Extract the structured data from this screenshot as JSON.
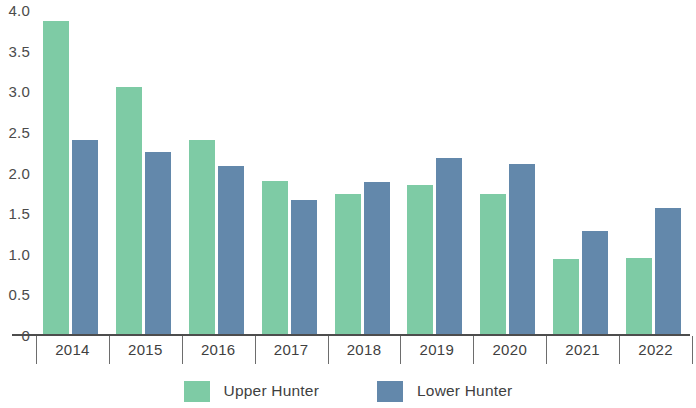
{
  "chart_data": {
    "type": "bar",
    "title": "",
    "xlabel": "",
    "ylabel": "",
    "categories": [
      "2014",
      "2015",
      "2016",
      "2017",
      "2018",
      "2019",
      "2020",
      "2021",
      "2022"
    ],
    "series": [
      {
        "name": "Upper Hunter",
        "color": "#7ecba5",
        "values": [
          3.87,
          3.05,
          2.4,
          1.9,
          1.73,
          1.85,
          1.74,
          0.93,
          0.95
        ]
      },
      {
        "name": "Lower Hunter",
        "color": "#6388ab",
        "values": [
          2.4,
          2.25,
          2.08,
          1.66,
          1.88,
          2.18,
          2.11,
          1.28,
          1.56
        ]
      }
    ],
    "ylim": [
      0,
      4.0
    ],
    "y_ticks": [
      "4.0",
      "3.5",
      "3.0",
      "2.5",
      "2.0",
      "1.5",
      "1.0",
      "0.5",
      "0"
    ],
    "y_tick_values": [
      4.0,
      3.5,
      3.0,
      2.5,
      2.0,
      1.5,
      1.0,
      0.5,
      0
    ],
    "grid": false,
    "legend_position": "bottom"
  },
  "legend": {
    "items": [
      {
        "label": "Upper Hunter",
        "color": "#7ecba5",
        "swatch_name": "legend-swatch-upper-hunter"
      },
      {
        "label": "Lower Hunter",
        "color": "#6388ab",
        "swatch_name": "legend-swatch-lower-hunter"
      }
    ]
  }
}
